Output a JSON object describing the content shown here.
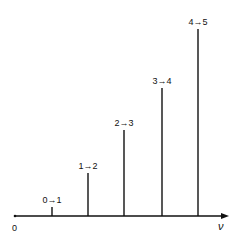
{
  "chart_data": {
    "type": "bar",
    "title": "",
    "xlabel": "ν",
    "ylabel": "",
    "origin_label": "0",
    "categories": [
      "0→1",
      "1→2",
      "2→3",
      "3→4",
      "4→5"
    ],
    "values": [
      1,
      5,
      10,
      15,
      21
    ],
    "grid": false,
    "legend": "none"
  },
  "diagram": {
    "axis": {
      "x1": 15,
      "x2": 229,
      "y": 216
    },
    "origin": {
      "text": "0",
      "x": 15,
      "y": 231
    },
    "nu": {
      "text": "ν",
      "x": 221,
      "y": 230
    },
    "lines": [
      {
        "label": "0→1",
        "x": 52,
        "top": 207
      },
      {
        "label": "1→2",
        "x": 88,
        "top": 173
      },
      {
        "label": "2→3",
        "x": 124,
        "top": 130
      },
      {
        "label": "3→4",
        "x": 162,
        "top": 88
      },
      {
        "label": "4→5",
        "x": 198,
        "top": 29
      }
    ]
  }
}
